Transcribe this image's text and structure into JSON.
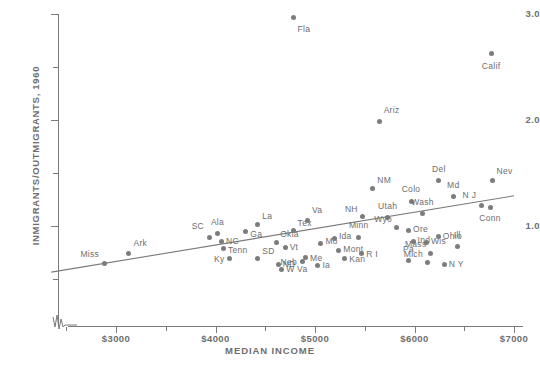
{
  "chart_data": {
    "type": "scatter",
    "title": "",
    "xlabel": "MEDIAN INCOME",
    "ylabel": "INMIGRANTS/OUTMIGRANTS, 1960",
    "xlim": [
      2300,
      7000
    ],
    "ylim": [
      0.35,
      3.05
    ],
    "grid": false,
    "legend": "none",
    "axis_break": "y-axis broken below lowest tick",
    "xticks": [
      {
        "value": 3000,
        "label": "$3000"
      },
      {
        "value": 4000,
        "label": "$4000"
      },
      {
        "value": 5000,
        "label": "$5000"
      },
      {
        "value": 6000,
        "label": "$6000"
      },
      {
        "value": 7000,
        "label": "$7000"
      }
    ],
    "xticks_minor": [
      2500,
      3500,
      4500,
      5500,
      6500
    ],
    "yticks": [
      {
        "value": 3.0,
        "label": "3.0"
      },
      {
        "value": 2.0,
        "label": "2.0"
      },
      {
        "value": 1.0,
        "label": "1.0"
      }
    ],
    "yticks_minor": [
      2.5,
      1.5,
      0.5
    ],
    "trend_line": {
      "x0": 2350,
      "y0": 0.565,
      "x1": 7000,
      "y1": 1.285
    },
    "points": [
      {
        "label": "Miss",
        "x": 2880,
        "y": 0.645,
        "lx": 2830,
        "ly": 0.69,
        "pos": "tl"
      },
      {
        "label": "Ark",
        "x": 3130,
        "y": 0.745,
        "lx": 3175,
        "ly": 0.79,
        "pos": "tr"
      },
      {
        "label": "SC",
        "x": 3940,
        "y": 0.89,
        "lx": 3885,
        "ly": 0.955,
        "pos": "tl"
      },
      {
        "label": "Ala",
        "x": 4020,
        "y": 0.93,
        "lx": 4020,
        "ly": 0.995,
        "pos": "t"
      },
      {
        "label": "NC",
        "x": 4060,
        "y": 0.855,
        "lx": 4105,
        "ly": 0.855,
        "pos": "r"
      },
      {
        "label": "Tenn",
        "x": 4080,
        "y": 0.785,
        "lx": 4125,
        "ly": 0.775,
        "pos": "r"
      },
      {
        "label": "Ky",
        "x": 4140,
        "y": 0.69,
        "lx": 4090,
        "ly": 0.69,
        "pos": "l"
      },
      {
        "label": "Ga",
        "x": 4300,
        "y": 0.945,
        "lx": 4350,
        "ly": 0.925,
        "pos": "r"
      },
      {
        "label": "La",
        "x": 4420,
        "y": 1.01,
        "lx": 4470,
        "ly": 1.045,
        "pos": "tr"
      },
      {
        "label": "SD",
        "x": 4420,
        "y": 0.69,
        "lx": 4470,
        "ly": 0.715,
        "pos": "tr"
      },
      {
        "label": "Okla",
        "x": 4610,
        "y": 0.84,
        "lx": 4650,
        "ly": 0.88,
        "pos": "tr"
      },
      {
        "label": "ND",
        "x": 4630,
        "y": 0.64,
        "lx": 4675,
        "ly": 0.64,
        "pos": "r"
      },
      {
        "label": "W Va",
        "x": 4665,
        "y": 0.59,
        "lx": 4710,
        "ly": 0.59,
        "pos": "r"
      },
      {
        "label": "Vt",
        "x": 4700,
        "y": 0.8,
        "lx": 4745,
        "ly": 0.8,
        "pos": "r"
      },
      {
        "label": "Me",
        "x": 4905,
        "y": 0.7,
        "lx": 4950,
        "ly": 0.7,
        "pos": "r"
      },
      {
        "label": "Neb",
        "x": 4870,
        "y": 0.665,
        "lx": 4820,
        "ly": 0.665,
        "pos": "l"
      },
      {
        "label": "Ia",
        "x": 5030,
        "y": 0.63,
        "lx": 5075,
        "ly": 0.63,
        "pos": "r"
      },
      {
        "label": "Tex",
        "x": 4780,
        "y": 0.955,
        "lx": 4825,
        "ly": 0.985,
        "pos": "tr"
      },
      {
        "label": "Va",
        "x": 4925,
        "y": 1.055,
        "lx": 4970,
        "ly": 1.1,
        "pos": "tr"
      },
      {
        "label": "Mo",
        "x": 5060,
        "y": 0.835,
        "lx": 5105,
        "ly": 0.855,
        "pos": "r"
      },
      {
        "label": "Ida",
        "x": 5195,
        "y": 0.885,
        "lx": 5240,
        "ly": 0.905,
        "pos": "r"
      },
      {
        "label": "Mont",
        "x": 5240,
        "y": 0.765,
        "lx": 5285,
        "ly": 0.78,
        "pos": "r"
      },
      {
        "label": "Kan",
        "x": 5300,
        "y": 0.69,
        "lx": 5345,
        "ly": 0.69,
        "pos": "r"
      },
      {
        "label": "Minn",
        "x": 5440,
        "y": 0.895,
        "lx": 5440,
        "ly": 0.96,
        "pos": "t"
      },
      {
        "label": "R I",
        "x": 5470,
        "y": 0.74,
        "lx": 5515,
        "ly": 0.74,
        "pos": "r"
      },
      {
        "label": "NM",
        "x": 5580,
        "y": 1.35,
        "lx": 5625,
        "ly": 1.39,
        "pos": "tr"
      },
      {
        "label": "NH",
        "x": 5480,
        "y": 1.085,
        "lx": 5430,
        "ly": 1.115,
        "pos": "tl"
      },
      {
        "label": "Utah",
        "x": 5730,
        "y": 1.08,
        "lx": 5730,
        "ly": 1.14,
        "pos": "t"
      },
      {
        "label": "Wyo",
        "x": 5820,
        "y": 0.985,
        "lx": 5775,
        "ly": 1.02,
        "pos": "tl"
      },
      {
        "label": "Colo",
        "x": 5965,
        "y": 1.235,
        "lx": 5965,
        "ly": 1.3,
        "pos": "t"
      },
      {
        "label": "Ind",
        "x": 5985,
        "y": 0.85,
        "lx": 6030,
        "ly": 0.87,
        "pos": "r"
      },
      {
        "label": "Ore",
        "x": 5940,
        "y": 0.96,
        "lx": 5985,
        "ly": 0.975,
        "pos": "r"
      },
      {
        "label": "Wash",
        "x": 6080,
        "y": 1.12,
        "lx": 6080,
        "ly": 1.18,
        "pos": "t"
      },
      {
        "label": "Wis",
        "x": 6120,
        "y": 0.845,
        "lx": 6165,
        "ly": 0.86,
        "pos": "r"
      },
      {
        "label": "Pa",
        "x": 5940,
        "y": 0.675,
        "lx": 5940,
        "ly": 0.74,
        "pos": "t"
      },
      {
        "label": "Mich",
        "x": 6130,
        "y": 0.655,
        "lx": 6085,
        "ly": 0.69,
        "pos": "tl"
      },
      {
        "label": "Ohio",
        "x": 6240,
        "y": 0.905,
        "lx": 6285,
        "ly": 0.905,
        "pos": "r"
      },
      {
        "label": "Mass",
        "x": 6165,
        "y": 0.74,
        "lx": 6120,
        "ly": 0.78,
        "pos": "tl"
      },
      {
        "label": "Ill",
        "x": 6430,
        "y": 0.805,
        "lx": 6430,
        "ly": 0.865,
        "pos": "t"
      },
      {
        "label": "N Y",
        "x": 6300,
        "y": 0.64,
        "lx": 6345,
        "ly": 0.64,
        "pos": "r"
      },
      {
        "label": "Del",
        "x": 6245,
        "y": 1.43,
        "lx": 6245,
        "ly": 1.495,
        "pos": "t"
      },
      {
        "label": "Md",
        "x": 6390,
        "y": 1.275,
        "lx": 6390,
        "ly": 1.34,
        "pos": "t"
      },
      {
        "label": "N J",
        "x": 6670,
        "y": 1.19,
        "lx": 6620,
        "ly": 1.245,
        "pos": "tl"
      },
      {
        "label": "Conn",
        "x": 6760,
        "y": 1.175,
        "lx": 6760,
        "ly": 1.12,
        "pos": "b"
      },
      {
        "label": "Nev",
        "x": 6780,
        "y": 1.425,
        "lx": 6825,
        "ly": 1.47,
        "pos": "tr"
      },
      {
        "label": "Ariz",
        "x": 5645,
        "y": 1.99,
        "lx": 5690,
        "ly": 2.05,
        "pos": "tr"
      },
      {
        "label": "Fla",
        "x": 4780,
        "y": 2.965,
        "lx": 4825,
        "ly": 2.91,
        "pos": "br"
      },
      {
        "label": "Calif",
        "x": 6770,
        "y": 2.625,
        "lx": 6770,
        "ly": 2.56,
        "pos": "b"
      }
    ]
  },
  "colors": {
    "point": "#7c7c7c",
    "axis": "#7a7a7a",
    "text": "#6e6e6e",
    "background": "#ffffff"
  }
}
